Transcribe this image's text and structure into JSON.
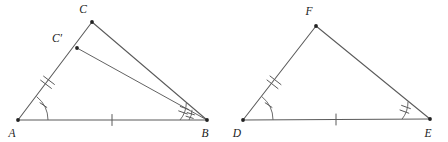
{
  "figure": {
    "background_color": "#ffffff",
    "line_color": "#5a5a5a",
    "label_color": "#1a1a1a"
  },
  "labels": {
    "A": "A",
    "B": "B",
    "C": "C",
    "C_prime": "C′",
    "D": "D",
    "E": "E",
    "F": "F"
  },
  "left_triangle": {
    "name": "triangle-abc",
    "vertices": {
      "A": {
        "x": 18,
        "y": 120
      },
      "B": {
        "x": 207,
        "y": 120
      },
      "C": {
        "x": 92,
        "y": 22
      },
      "C_prime": {
        "x": 77,
        "y": 48
      }
    },
    "label_positions": {
      "A": {
        "x": 12,
        "y": 137
      },
      "B": {
        "x": 205,
        "y": 137
      },
      "C": {
        "x": 83,
        "y": 13
      },
      "C_prime": {
        "x": 57,
        "y": 42
      }
    },
    "sides": [
      {
        "name": "side-ab",
        "from": "A",
        "to": "B",
        "ticks": 1
      },
      {
        "name": "side-ac",
        "from": "A",
        "to": "C",
        "ticks": 2
      },
      {
        "name": "side-bc",
        "from": "B",
        "to": "C",
        "ticks": 0
      },
      {
        "name": "segment-bc-prime",
        "from": "B",
        "to": "C_prime",
        "ticks": 0
      }
    ],
    "angles": [
      {
        "name": "angle-a",
        "vertex": "A",
        "arcs": 1,
        "ticks": 1
      },
      {
        "name": "angle-b-upper",
        "vertex": "B",
        "arcs": 1,
        "ticks": 2
      },
      {
        "name": "angle-b-lower",
        "vertex": "B",
        "arcs": 1,
        "ticks": 2
      }
    ]
  },
  "right_triangle": {
    "name": "triangle-def",
    "vertices": {
      "D": {
        "x": 243,
        "y": 120
      },
      "E": {
        "x": 430,
        "y": 119
      },
      "F": {
        "x": 316,
        "y": 26
      }
    },
    "label_positions": {
      "D": {
        "x": 237,
        "y": 137
      },
      "E": {
        "x": 428,
        "y": 137
      },
      "F": {
        "x": 309,
        "y": 15
      }
    },
    "sides": [
      {
        "name": "side-de",
        "from": "D",
        "to": "E",
        "ticks": 1
      },
      {
        "name": "side-df",
        "from": "D",
        "to": "F",
        "ticks": 2
      },
      {
        "name": "side-ef",
        "from": "E",
        "to": "F",
        "ticks": 0
      }
    ],
    "angles": [
      {
        "name": "angle-d",
        "vertex": "D",
        "arcs": 1,
        "ticks": 1
      },
      {
        "name": "angle-e",
        "vertex": "E",
        "arcs": 1,
        "ticks": 2
      }
    ]
  }
}
